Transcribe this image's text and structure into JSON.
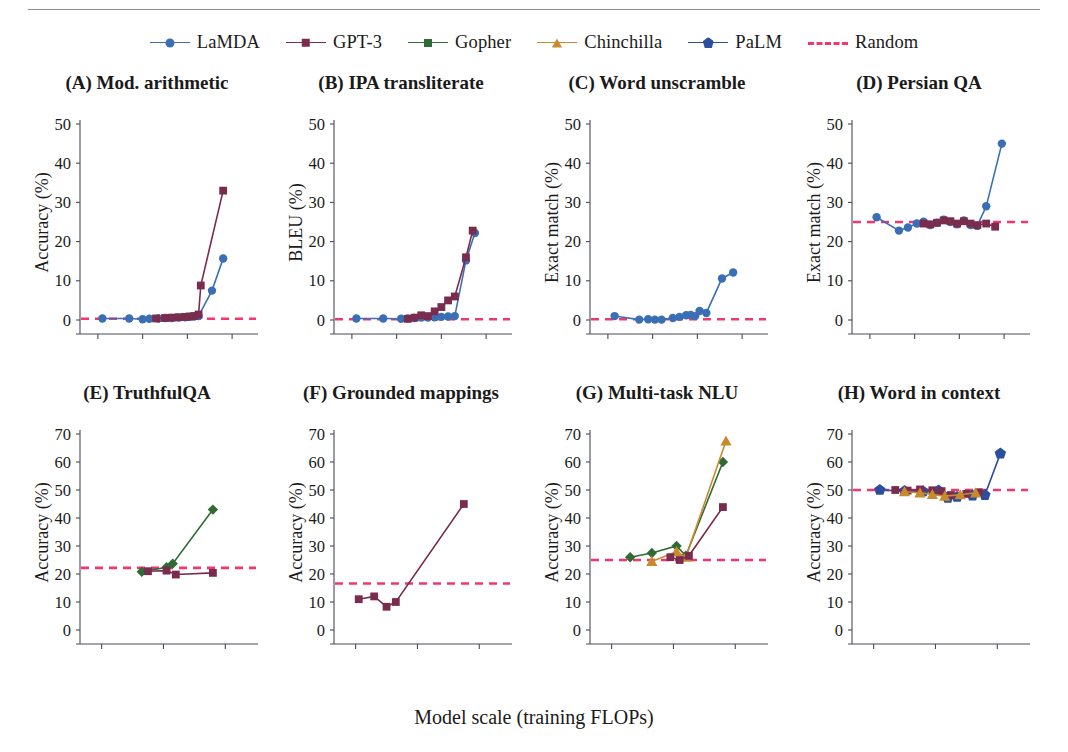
{
  "figure": {
    "xaxis_caption": "Model scale (training FLOPs)",
    "legend_position": "top-center",
    "random_color": "#f4366e"
  },
  "legend": {
    "items": [
      {
        "label": "LaMDA",
        "color": "#3a6fb5",
        "marker": "circle",
        "icon": "circle-marker-icon"
      },
      {
        "label": "GPT-3",
        "color": "#7a2c4e",
        "marker": "square",
        "icon": "square-marker-icon"
      },
      {
        "label": "Gopher",
        "color": "#2f6b35",
        "marker": "diamond",
        "icon": "diamond-marker-icon"
      },
      {
        "label": "Chinchilla",
        "color": "#c98a2e",
        "marker": "triangle",
        "icon": "triangle-marker-icon"
      },
      {
        "label": "PaLM",
        "color": "#2b4f9e",
        "marker": "pentagon",
        "icon": "pentagon-marker-icon"
      },
      {
        "label": "Random",
        "color": "#f4366e",
        "marker": "dashed",
        "icon": "dashed-line-icon"
      }
    ]
  },
  "chart_data": [
    {
      "id": "A",
      "type": "line",
      "title": "(A) Mod. arithmetic",
      "ylabel": "Accuracy (%)",
      "xlabel": "",
      "xlim": [
        17.2,
        24.8
      ],
      "ylim": [
        0,
        50
      ],
      "yticks": [
        0,
        10,
        20,
        30,
        40,
        50
      ],
      "xticks": [
        18,
        20,
        22,
        24
      ],
      "xtick_labels": [
        "10^18",
        "10^20",
        "10^22",
        "10^24"
      ],
      "random_baseline": 0.3,
      "grid": false,
      "series": [
        {
          "name": "LaMDA",
          "color": "#3a6fb5",
          "marker": "circle",
          "x": [
            18.2,
            19.4,
            20.0,
            20.3,
            20.7,
            21.0,
            21.3,
            21.6,
            21.9,
            22.1,
            22.3,
            22.5,
            23.1,
            23.6
          ],
          "y": [
            0.4,
            0.4,
            0.2,
            0.3,
            0.4,
            0.5,
            0.5,
            0.6,
            0.7,
            0.8,
            0.9,
            1.0,
            7.5,
            15.7
          ]
        },
        {
          "name": "GPT-3",
          "color": "#7a2c4e",
          "marker": "square",
          "x": [
            20.6,
            21.0,
            21.3,
            21.6,
            21.9,
            22.1,
            22.3,
            22.5,
            22.6,
            23.6
          ],
          "y": [
            0.4,
            0.5,
            0.6,
            0.7,
            0.8,
            0.9,
            1.0,
            1.4,
            8.8,
            33.0
          ]
        }
      ]
    },
    {
      "id": "B",
      "type": "line",
      "title": "(B) IPA transliterate",
      "ylabel": "BLEU (%)",
      "xlabel": "",
      "xlim": [
        17.2,
        24.8
      ],
      "ylim": [
        0,
        50
      ],
      "yticks": [
        0,
        10,
        20,
        30,
        40,
        50
      ],
      "xticks": [
        18,
        20,
        22,
        24
      ],
      "xtick_labels": [
        "10^18",
        "10^20",
        "10^22",
        "10^24"
      ],
      "random_baseline": 0.2,
      "grid": false,
      "series": [
        {
          "name": "LaMDA",
          "color": "#3a6fb5",
          "marker": "circle",
          "x": [
            18.2,
            19.4,
            20.2,
            20.5,
            20.8,
            21.1,
            21.4,
            21.7,
            22.0,
            22.3,
            22.6,
            23.1,
            23.5
          ],
          "y": [
            0.4,
            0.4,
            0.3,
            0.4,
            0.5,
            0.6,
            0.6,
            0.7,
            0.8,
            0.9,
            1.0,
            15.2,
            22.2
          ]
        },
        {
          "name": "GPT-3",
          "color": "#7a2c4e",
          "marker": "square",
          "x": [
            20.5,
            20.8,
            21.1,
            21.4,
            21.7,
            22.0,
            22.3,
            22.6,
            23.1,
            23.4
          ],
          "y": [
            0.3,
            0.6,
            1.2,
            1.0,
            2.2,
            3.3,
            5.0,
            6.0,
            16.0,
            22.8
          ]
        }
      ]
    },
    {
      "id": "C",
      "type": "line",
      "title": "(C) Word unscramble",
      "ylabel": "Exact match (%)",
      "xlabel": "",
      "xlim": [
        17.2,
        24.8
      ],
      "ylim": [
        0,
        50
      ],
      "yticks": [
        0,
        10,
        20,
        30,
        40,
        50
      ],
      "xticks": [
        18,
        20,
        22,
        24
      ],
      "xtick_labels": [
        "10^18",
        "10^20",
        "10^22",
        "10^24"
      ],
      "random_baseline": 0.2,
      "grid": false,
      "series": [
        {
          "name": "LaMDA",
          "color": "#3a6fb5",
          "marker": "circle",
          "x": [
            18.3,
            19.4,
            19.8,
            20.1,
            20.4,
            20.9,
            21.2,
            21.5,
            21.7,
            21.9,
            22.1,
            22.4,
            23.1,
            23.6
          ],
          "y": [
            1.0,
            0.1,
            0.2,
            0.1,
            0.1,
            0.5,
            0.8,
            1.2,
            1.3,
            1.0,
            2.3,
            1.8,
            10.6,
            12.1
          ]
        }
      ]
    },
    {
      "id": "D",
      "type": "line",
      "title": "(D) Persian QA",
      "ylabel": "Exact match (%)",
      "xlabel": "",
      "xlim": [
        17.2,
        24.8
      ],
      "ylim": [
        0,
        50
      ],
      "yticks": [
        0,
        10,
        20,
        30,
        40,
        50
      ],
      "xticks": [
        18,
        20,
        22,
        24
      ],
      "xtick_labels": [
        "10^18",
        "10^20",
        "10^22",
        "10^24"
      ],
      "random_baseline": 25.0,
      "grid": false,
      "series": [
        {
          "name": "LaMDA",
          "color": "#3a6fb5",
          "marker": "circle",
          "x": [
            18.3,
            19.3,
            19.7,
            20.1,
            20.4,
            20.7,
            21.0,
            21.3,
            21.6,
            21.9,
            22.2,
            22.5,
            22.8,
            23.2,
            23.9
          ],
          "y": [
            26.2,
            22.8,
            23.6,
            24.6,
            25.1,
            24.2,
            24.8,
            25.6,
            25.0,
            24.4,
            25.4,
            24.2,
            24.0,
            29.0,
            45.0
          ]
        },
        {
          "name": "GPT-3",
          "color": "#7a2c4e",
          "marker": "square",
          "x": [
            20.4,
            20.7,
            21.0,
            21.3,
            21.6,
            21.9,
            22.2,
            22.5,
            22.8,
            23.2,
            23.6
          ],
          "y": [
            24.6,
            24.4,
            24.8,
            25.4,
            25.2,
            24.6,
            25.2,
            24.6,
            24.2,
            24.6,
            23.8
          ]
        }
      ]
    },
    {
      "id": "E",
      "type": "line",
      "title": "(E) TruthfulQA",
      "ylabel": "Accuracy (%)",
      "xlabel": "",
      "xlim": [
        19.3,
        24.8
      ],
      "ylim": [
        0,
        70
      ],
      "yticks": [
        0,
        10,
        20,
        30,
        40,
        50,
        60,
        70
      ],
      "xticks": [
        20,
        22,
        24
      ],
      "xtick_labels": [
        "10^20",
        "10^22",
        "10^24"
      ],
      "random_baseline": 22.2,
      "grid": false,
      "series": [
        {
          "name": "Gopher",
          "color": "#2f6b35",
          "marker": "diamond",
          "x": [
            21.3,
            22.1,
            22.3,
            23.6
          ],
          "y": [
            20.8,
            22.4,
            23.7,
            43.0
          ]
        },
        {
          "name": "GPT-3",
          "color": "#7a2c4e",
          "marker": "square",
          "x": [
            21.5,
            22.1,
            22.4,
            23.6
          ],
          "y": [
            21.0,
            21.2,
            19.8,
            20.4
          ]
        }
      ]
    },
    {
      "id": "F",
      "type": "line",
      "title": "(F) Grounded mappings",
      "ylabel": "Accuracy (%)",
      "xlabel": "",
      "xlim": [
        19.3,
        24.8
      ],
      "ylim": [
        0,
        70
      ],
      "yticks": [
        0,
        10,
        20,
        30,
        40,
        50,
        60,
        70
      ],
      "xticks": [
        20,
        22,
        24
      ],
      "xtick_labels": [
        "10^20",
        "10^22",
        "10^24"
      ],
      "random_baseline": 16.6,
      "grid": false,
      "series": [
        {
          "name": "GPT-3",
          "color": "#7a2c4e",
          "marker": "square",
          "x": [
            20.1,
            20.6,
            21.0,
            21.3,
            23.5
          ],
          "y": [
            11.0,
            12.0,
            8.3,
            10.0,
            45.0
          ]
        }
      ]
    },
    {
      "id": "G",
      "type": "line",
      "title": "(G) Multi-task NLU",
      "ylabel": "Accuracy (%)",
      "xlabel": "",
      "xlim": [
        19.3,
        24.8
      ],
      "ylim": [
        0,
        70
      ],
      "yticks": [
        0,
        10,
        20,
        30,
        40,
        50,
        60,
        70
      ],
      "xticks": [
        20,
        22,
        24
      ],
      "xtick_labels": [
        "10^20",
        "10^22",
        "10^24"
      ],
      "random_baseline": 25.0,
      "grid": false,
      "series": [
        {
          "name": "Gopher",
          "color": "#2f6b35",
          "marker": "diamond",
          "x": [
            20.6,
            21.3,
            22.1,
            22.4,
            23.6
          ],
          "y": [
            26.0,
            27.5,
            30.0,
            26.5,
            60.0
          ]
        },
        {
          "name": "Chinchilla",
          "color": "#c98a2e",
          "marker": "triangle",
          "x": [
            21.3,
            22.1,
            22.4,
            23.7
          ],
          "y": [
            24.5,
            28.0,
            26.0,
            67.5
          ]
        },
        {
          "name": "GPT-3",
          "color": "#7a2c4e",
          "marker": "square",
          "x": [
            21.9,
            22.2,
            22.5,
            23.6
          ],
          "y": [
            26.0,
            25.0,
            26.5,
            43.9
          ]
        }
      ]
    },
    {
      "id": "H",
      "type": "line",
      "title": "(H) Word in context",
      "ylabel": "Accuracy (%)",
      "xlabel": "",
      "xlim": [
        19.3,
        24.8
      ],
      "ylim": [
        0,
        70
      ],
      "yticks": [
        0,
        10,
        20,
        30,
        40,
        50,
        60,
        70
      ],
      "xticks": [
        20,
        22,
        24
      ],
      "xtick_labels": [
        "10^20",
        "10^22",
        "10^24"
      ],
      "random_baseline": 50.0,
      "grid": false,
      "series": [
        {
          "name": "PaLM",
          "color": "#2b4f9e",
          "marker": "pentagon",
          "x": [
            20.2,
            21.0,
            21.6,
            22.1,
            22.4,
            22.7,
            23.2,
            23.6,
            24.1
          ],
          "y": [
            50.0,
            49.6,
            49.5,
            49.8,
            47.2,
            47.5,
            48.0,
            48.2,
            63.0
          ]
        },
        {
          "name": "GPT-3",
          "color": "#7a2c4e",
          "marker": "square",
          "x": [
            20.7,
            21.1,
            21.5,
            21.9,
            22.2,
            22.5,
            23.0,
            23.4
          ],
          "y": [
            50.0,
            49.8,
            50.2,
            49.9,
            49.6,
            48.2,
            48.6,
            49.2
          ]
        },
        {
          "name": "Chinchilla",
          "color": "#c98a2e",
          "marker": "triangle",
          "x": [
            21.0,
            21.5,
            21.9,
            22.3,
            22.8,
            23.3
          ],
          "y": [
            49.4,
            49.0,
            48.4,
            47.8,
            48.3,
            49.0
          ]
        }
      ]
    }
  ]
}
